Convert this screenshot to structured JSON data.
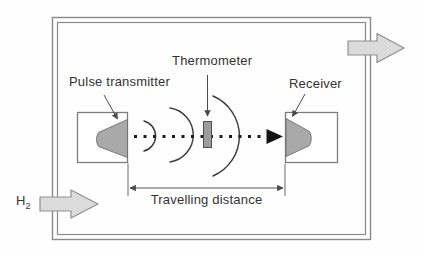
{
  "diagram": {
    "labels": {
      "pulse_transmitter": "Pulse transmitter",
      "thermometer": "Thermometer",
      "receiver": "Receiver",
      "travelling_distance": "Travelling distance",
      "gas_symbol": "H",
      "gas_subscript": "2"
    },
    "colors": {
      "chamber_border": "#8a8a8a",
      "box_border": "#7d7d7d",
      "box_fill": "#ffffff",
      "horn_fill": "#a9a9a9",
      "horn_border": "#6e6e6e",
      "block_arrow_fill": "#dbdbdb",
      "block_arrow_border": "#8f8f8f",
      "thermometer_fill": "#9c9c9c",
      "thermometer_border": "#4f4f4f",
      "beam_color": "#1c1c1c",
      "wave_color": "#3a3a3a",
      "leader_color": "#4a4a4a",
      "dimension_color": "#555555",
      "text_color": "#333333",
      "background": "#fefefe"
    }
  }
}
